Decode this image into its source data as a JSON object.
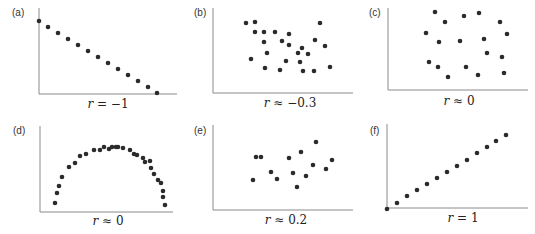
{
  "chart_data": [
    {
      "id": "a",
      "type": "scatter",
      "panel_label": "(a)",
      "caption_var": "r",
      "caption_rest": " = −1",
      "caption": "r = −1",
      "grid": false,
      "axis": {
        "x0": 39,
        "y0": 94,
        "x1": 177,
        "ytop": 8
      },
      "points": [
        [
          39,
          21
        ],
        [
          48,
          27
        ],
        [
          58,
          33
        ],
        [
          68,
          39
        ],
        [
          78,
          45
        ],
        [
          88,
          51
        ],
        [
          98,
          57
        ],
        [
          108,
          63
        ],
        [
          118,
          69
        ],
        [
          128,
          75
        ],
        [
          138,
          81
        ],
        [
          148,
          87
        ],
        [
          157,
          93
        ]
      ]
    },
    {
      "id": "b",
      "type": "scatter",
      "panel_label": "(b)",
      "caption_var": "r",
      "caption_rest": " ≈ −0.3",
      "caption": "r ≈ −0.3",
      "grid": false,
      "axis": {
        "x0": 213,
        "y0": 93,
        "x1": 353,
        "ytop": 8
      },
      "points": [
        [
          246,
          23
        ],
        [
          255,
          22
        ],
        [
          320,
          23
        ],
        [
          255,
          32
        ],
        [
          264,
          32
        ],
        [
          275,
          32
        ],
        [
          289,
          34
        ],
        [
          264,
          42
        ],
        [
          282,
          41
        ],
        [
          315,
          40
        ],
        [
          289,
          45
        ],
        [
          325,
          46
        ],
        [
          302,
          48
        ],
        [
          298,
          53
        ],
        [
          308,
          54
        ],
        [
          267,
          53
        ],
        [
          251,
          59
        ],
        [
          286,
          61
        ],
        [
          300,
          62
        ],
        [
          330,
          67
        ],
        [
          265,
          68
        ],
        [
          280,
          70
        ],
        [
          303,
          71
        ],
        [
          314,
          71
        ]
      ]
    },
    {
      "id": "c",
      "type": "scatter",
      "panel_label": "(c)",
      "caption_var": "r",
      "caption_rest": " ≈ 0",
      "caption": "r ≈ 0",
      "grid": false,
      "axis": {
        "x0": 388,
        "y0": 90,
        "x1": 528,
        "ytop": 8
      },
      "points": [
        [
          435,
          12
        ],
        [
          464,
          16
        ],
        [
          479,
          13
        ],
        [
          445,
          22
        ],
        [
          500,
          22
        ],
        [
          426,
          33
        ],
        [
          507,
          34
        ],
        [
          439,
          42
        ],
        [
          460,
          41
        ],
        [
          484,
          39
        ],
        [
          487,
          53
        ],
        [
          502,
          57
        ],
        [
          429,
          62
        ],
        [
          438,
          67
        ],
        [
          466,
          67
        ],
        [
          448,
          77
        ],
        [
          478,
          75
        ],
        [
          504,
          73
        ]
      ]
    },
    {
      "id": "d",
      "type": "scatter",
      "panel_label": "(d)",
      "caption_var": "r",
      "caption_rest": " ≈ 0",
      "caption": "r ≈ 0",
      "grid": false,
      "axis": {
        "x0": 40,
        "y0": 212,
        "x1": 173,
        "ytop": 126
      },
      "points": [
        [
          55,
          203
        ],
        [
          57,
          193
        ],
        [
          59,
          186
        ],
        [
          62,
          177
        ],
        [
          69,
          167
        ],
        [
          75,
          163
        ],
        [
          80,
          156
        ],
        [
          86,
          154
        ],
        [
          94,
          150
        ],
        [
          100,
          150
        ],
        [
          104,
          147
        ],
        [
          109,
          149
        ],
        [
          112,
          147
        ],
        [
          116,
          147
        ],
        [
          118,
          147
        ],
        [
          123,
          148
        ],
        [
          130,
          150
        ],
        [
          134,
          154
        ],
        [
          137,
          155
        ],
        [
          143,
          158
        ],
        [
          145,
          162
        ],
        [
          150,
          161
        ],
        [
          151,
          168
        ],
        [
          154,
          174
        ],
        [
          158,
          180
        ],
        [
          161,
          183
        ],
        [
          163,
          191
        ],
        [
          163,
          197
        ],
        [
          165,
          205
        ]
      ]
    },
    {
      "id": "e",
      "type": "scatter",
      "panel_label": "(e)",
      "caption_var": "r",
      "caption_rest": " ≈ 0.2",
      "caption": "r ≈ 0.2",
      "grid": false,
      "axis": {
        "x0": 213,
        "y0": 210,
        "x1": 353,
        "ytop": 125
      },
      "points": [
        [
          256,
          157
        ],
        [
          261,
          157
        ],
        [
          316,
          142
        ],
        [
          301,
          152
        ],
        [
          289,
          158
        ],
        [
          332,
          160
        ],
        [
          313,
          165
        ],
        [
          326,
          169
        ],
        [
          271,
          172
        ],
        [
          293,
          173
        ],
        [
          253,
          180
        ],
        [
          277,
          179
        ],
        [
          306,
          176
        ],
        [
          297,
          187
        ]
      ]
    },
    {
      "id": "f",
      "type": "scatter",
      "panel_label": "(f)",
      "caption_var": "r",
      "caption_rest": " = 1",
      "caption": "r = 1",
      "grid": false,
      "axis": {
        "x0": 387,
        "y0": 208,
        "x1": 528,
        "ytop": 124
      },
      "points": [
        [
          387,
          209
        ],
        [
          397,
          203
        ],
        [
          407,
          196
        ],
        [
          417,
          190
        ],
        [
          427,
          184
        ],
        [
          437,
          178
        ],
        [
          447,
          172
        ],
        [
          457,
          166
        ],
        [
          467,
          160
        ],
        [
          477,
          153
        ],
        [
          487,
          147
        ],
        [
          496,
          141
        ],
        [
          506,
          135
        ]
      ]
    }
  ],
  "layout": {
    "labels": [
      {
        "id": "a",
        "x": 12,
        "y": 7
      },
      {
        "id": "b",
        "x": 194,
        "y": 7
      },
      {
        "id": "c",
        "x": 369,
        "y": 7
      },
      {
        "id": "d",
        "x": 13,
        "y": 125
      },
      {
        "id": "e",
        "x": 194,
        "y": 125
      },
      {
        "id": "f",
        "x": 370,
        "y": 125
      }
    ],
    "captions": [
      {
        "id": "a",
        "cx": 108,
        "y": 97
      },
      {
        "id": "b",
        "cx": 290,
        "y": 96
      },
      {
        "id": "c",
        "cx": 459,
        "y": 94
      },
      {
        "id": "d",
        "cx": 108,
        "y": 214
      },
      {
        "id": "e",
        "cx": 286,
        "y": 213
      },
      {
        "id": "f",
        "cx": 463,
        "y": 211
      }
    ]
  },
  "colors": {
    "point": "#2b2b2b",
    "axis": "#8a8a8a",
    "text": "#222222"
  }
}
